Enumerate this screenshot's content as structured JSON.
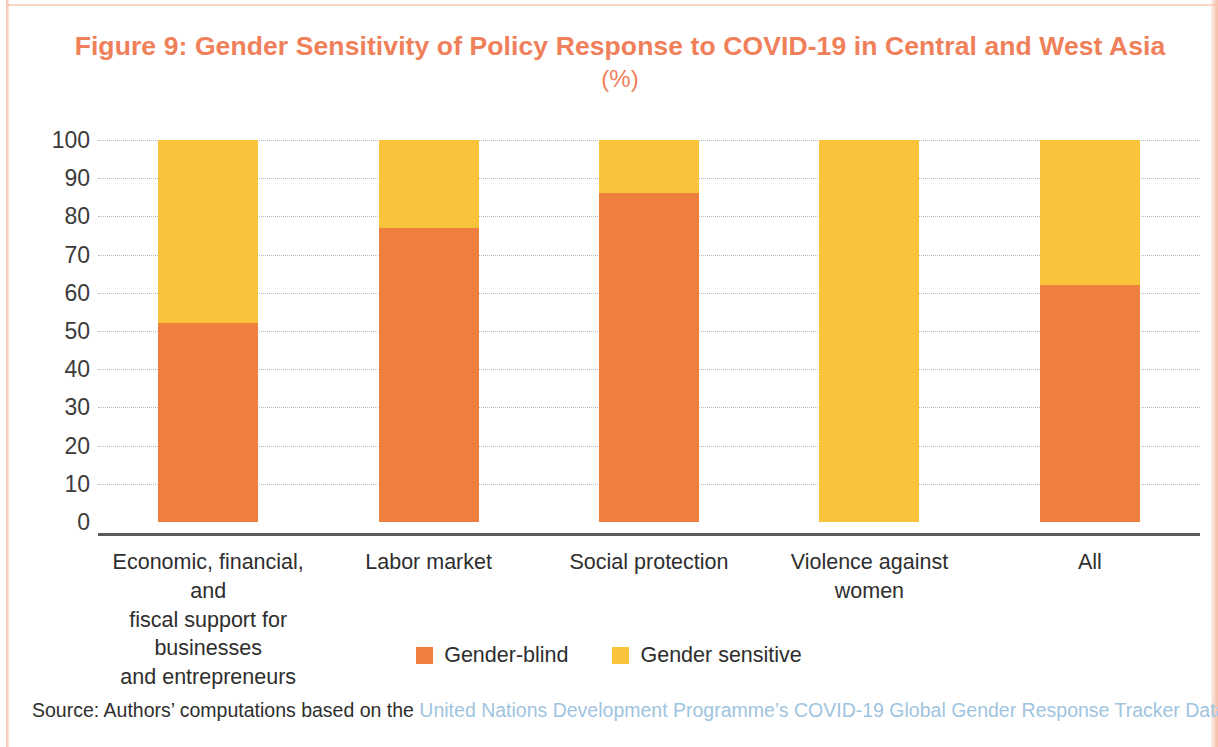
{
  "figure": {
    "title": "Figure 9: Gender Sensitivity of Policy Response to COVID-19 in Central and West Asia",
    "subtitle": "(%)"
  },
  "source": {
    "prefix": "Source: Authors’ computations based on the ",
    "link_text": "United Nations Development Programme’s COVID-19 Global Gender Response Tracker Database",
    "suffix": "."
  },
  "legend": {
    "position": "bottom-center",
    "items": [
      {
        "label": "Gender-blind",
        "color": "#EF7F3F",
        "swatch_name": "legend-swatch-gender-blind"
      },
      {
        "label": "Gender sensitive",
        "color": "#FAC33C",
        "swatch_name": "legend-swatch-gender-sensitive"
      }
    ]
  },
  "colors": {
    "gender_blind": "#EF7F3F",
    "gender_sensitive": "#FAC33C",
    "title": "#F0805A",
    "source_link": "#9FC4E0",
    "axis": "#5A5A5A",
    "gridline": "#9AA3AD"
  },
  "chart_data": {
    "type": "bar",
    "stacked": true,
    "title": "Figure 9: Gender Sensitivity of Policy Response to COVID-19 in Central and West Asia (%)",
    "xlabel": "",
    "ylabel": "",
    "ylim": [
      0,
      100
    ],
    "yticks": [
      0,
      10,
      20,
      30,
      40,
      50,
      60,
      70,
      80,
      90,
      100
    ],
    "ytick_labels": [
      "0",
      "10",
      "20",
      "30",
      "40",
      "50",
      "60",
      "70",
      "80",
      "90",
      "100"
    ],
    "grid": true,
    "grid_axis": "y",
    "legend_position": "bottom-center",
    "categories": [
      "Economic, financial, and fiscal support for businesses and entrepreneurs",
      "Labor market",
      "Social protection",
      "Violence against women",
      "All"
    ],
    "category_lines": [
      [
        "Economic, financial, and",
        "fiscal support for businesses",
        "and entrepreneurs"
      ],
      [
        "Labor market"
      ],
      [
        "Social protection"
      ],
      [
        "Violence against",
        "women"
      ],
      [
        "All"
      ]
    ],
    "series": [
      {
        "name": "Gender-blind",
        "color": "#EF7F3F",
        "values": [
          52,
          77,
          86,
          0,
          62
        ]
      },
      {
        "name": "Gender sensitive",
        "color": "#FAC33C",
        "values": [
          48,
          23,
          14,
          100,
          38
        ]
      }
    ]
  }
}
